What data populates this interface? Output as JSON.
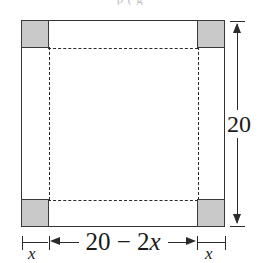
{
  "figure": {
    "clipped_top_text": "p                   (     g",
    "labels": {
      "height": "20",
      "width": "20 − 2x",
      "width_number": "20 − 2",
      "width_variable": "x",
      "x_left": "x",
      "x_right": "x"
    },
    "colors": {
      "corner_fill": "#c9c9c9",
      "stroke": "#333333",
      "dashed_stroke": "#2b2b2b",
      "background": "#ffffff"
    }
  },
  "chart_data": {
    "type": "diagram",
    "shape": "square",
    "side_length": 20,
    "corner_cut_side": "x",
    "base_side": "20 - 2x",
    "annotations": [
      {
        "name": "height-dimension",
        "text": "20",
        "position": "right",
        "arrows": "both"
      },
      {
        "name": "width-dimension",
        "text": "20 − 2x",
        "position": "bottom-center",
        "arrows": "both"
      },
      {
        "name": "corner-left-dimension",
        "text": "x",
        "position": "bottom-left",
        "arrows": "ticks"
      },
      {
        "name": "corner-right-dimension",
        "text": "x",
        "position": "bottom-right",
        "arrows": "ticks"
      }
    ],
    "shaded_regions": 4,
    "shaded_region_label": "corner squares of side x (removed)",
    "dashed_lines": "fold lines forming inner square of side 20 - 2x"
  }
}
